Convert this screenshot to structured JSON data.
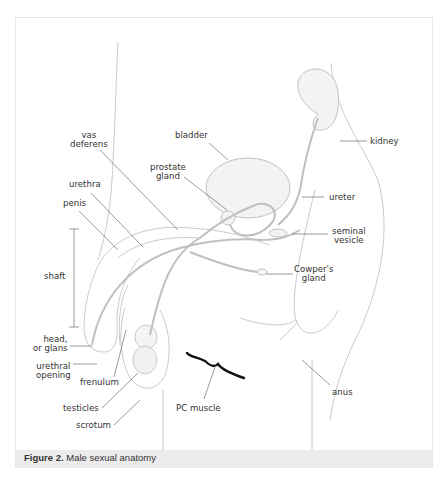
{
  "figure": {
    "caption_number": "Figure 2.",
    "caption_text": "Male sexual anatomy",
    "caption_bar_color": "#ececec",
    "frame_border_color": "#e6e6e6"
  },
  "labels": {
    "vas_deferens_1": "vas",
    "vas_deferens_2": "deferens",
    "bladder": "bladder",
    "kidney": "kidney",
    "prostate_1": "prostate",
    "prostate_2": "gland",
    "urethra": "urethra",
    "penis": "penis",
    "ureter": "ureter",
    "seminal_1": "seminal",
    "seminal_2": "vesicle",
    "shaft": "shaft",
    "cowpers_1": "Cowper's",
    "cowpers_2": "gland",
    "head_1": "head,",
    "head_2": "or glans",
    "urethral_1": "urethral",
    "urethral_2": "opening",
    "frenulum": "frenulum",
    "pc_muscle": "PC muscle",
    "anus": "anus",
    "testicles": "testicles",
    "scrotum": "scrotum"
  },
  "colors": {
    "line": "#555555",
    "sketch": "#bdbdbd",
    "pc_muscle": "#111111"
  }
}
